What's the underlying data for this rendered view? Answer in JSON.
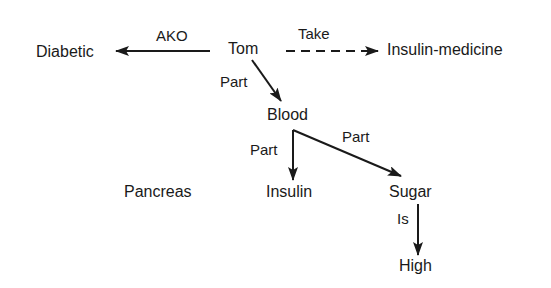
{
  "diagram": {
    "type": "semantic-network",
    "nodes": {
      "tom": "Tom",
      "diabetic": "Diabetic",
      "insulin_medicine": "Insulin-medicine",
      "blood": "Blood",
      "insulin": "Insulin",
      "sugar": "Sugar",
      "high": "High",
      "pancreas": "Pancreas"
    },
    "edges": {
      "tom_diabetic": {
        "label": "AKO",
        "style": "solid"
      },
      "tom_insulin_medicine": {
        "label": "Take",
        "style": "dashed"
      },
      "tom_blood": {
        "label": "Part",
        "style": "solid"
      },
      "blood_insulin": {
        "label": "Part",
        "style": "solid"
      },
      "blood_sugar": {
        "label": "Part",
        "style": "solid"
      },
      "sugar_high": {
        "label": "Is",
        "style": "solid"
      }
    },
    "colors": {
      "ink": "#1a1a1a",
      "background": "#ffffff"
    }
  }
}
